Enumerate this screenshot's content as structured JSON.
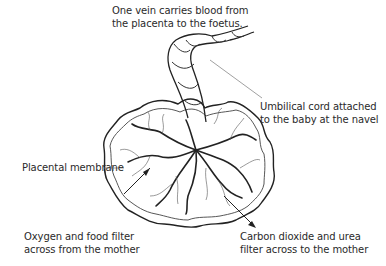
{
  "diagram": {
    "labels": {
      "vein": [
        "One vein carries blood from",
        "the placenta to the foetus."
      ],
      "cord": [
        "Umbilical cord attached",
        "to the baby at the navel"
      ],
      "membrane": [
        "Placental membrane"
      ],
      "oxygen": [
        "Oxygen and food filter",
        "across from the mother"
      ],
      "carbon": [
        "Carbon dioxide and urea",
        "filter across to the mother"
      ]
    },
    "colors": {
      "line": "#222222",
      "text": "#2a2a2a",
      "leader": "#777777",
      "background": "#ffffff"
    }
  }
}
